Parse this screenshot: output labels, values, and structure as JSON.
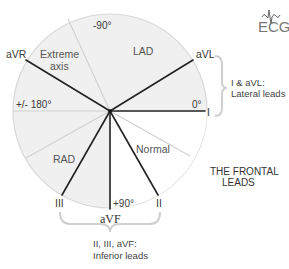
{
  "diagram": {
    "title_lines": [
      "THE FRONTAL",
      "LEADS"
    ],
    "logo": {
      "text": "ECG",
      "icon": "ecg-wave-icon"
    },
    "colors": {
      "shaded_sector": "#f0f0f0",
      "normal_sector": "#ffffff",
      "circle_border": "#d8d8d8",
      "boundary_line": "#d0d0d0",
      "lead_line": "#222222",
      "brace": "#cfcfcf"
    },
    "leads": [
      {
        "name": "I",
        "angle_deg": 0
      },
      {
        "name": "aVL",
        "angle_deg": -30
      },
      {
        "name": "aVR",
        "angle_deg": -150
      },
      {
        "name": "II",
        "angle_deg": 60
      },
      {
        "name": "III",
        "angle_deg": 120
      },
      {
        "name": "aVF",
        "angle_deg": 90
      }
    ],
    "lead_labels": {
      "I": "I",
      "aVL": "aVL",
      "aVR": "aVR",
      "II": "II",
      "III": "III",
      "aVF": "aVF"
    },
    "degree_labels": {
      "minus90": "-90°",
      "zero": "0°",
      "plus_minus_180": "+/- 180°",
      "plus90": "+90°"
    },
    "sectors": {
      "lad": "LAD",
      "extreme_line1": "Extreme",
      "extreme_line2": "axis",
      "rad": "RAD",
      "normal": "Normal"
    },
    "groups": {
      "lateral_line1": "I & aVL:",
      "lateral_line2": "Lateral leads",
      "inferior_line1": "II, III, aVF:",
      "inferior_line2": "Inferior leads"
    }
  }
}
